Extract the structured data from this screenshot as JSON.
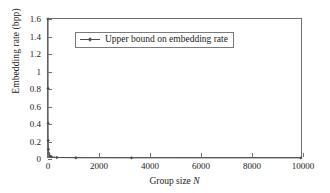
{
  "chart_data": {
    "type": "line",
    "title": "",
    "xlabel": "Group size N",
    "xlabel_plain": "Group size ",
    "xlabel_italic": "N",
    "ylabel": "Embedding rate (bpp)",
    "xlim": [
      0,
      10000
    ],
    "ylim": [
      0,
      1.6
    ],
    "grid": false,
    "legend_position": "upper-center",
    "xticks": [
      0,
      2000,
      4000,
      6000,
      8000,
      10000
    ],
    "xticklabels": [
      "0",
      "2000",
      "4000",
      "6000",
      "8000",
      "10000"
    ],
    "yticks": [
      0,
      0.2,
      0.4,
      0.6,
      0.8,
      1,
      1.2,
      1.4,
      1.6
    ],
    "yticklabels": [
      "0",
      "0.2",
      "0.4",
      "0.6",
      "0.8",
      "1",
      "1.2",
      "1.4",
      "1.6"
    ],
    "series": [
      {
        "name": "Upper bound on embedding rate",
        "marker": "diamond",
        "color": "#4d4d4d",
        "x": [
          1,
          2,
          4,
          8,
          16,
          32,
          64,
          128,
          350,
          1100,
          3300,
          10000
        ],
        "y": [
          1.6,
          0.8,
          0.4,
          0.2,
          0.1,
          0.05,
          0.025,
          0.0125,
          0.0046,
          0.0015,
          0.0005,
          0.00016
        ]
      }
    ]
  },
  "legend": {
    "entries": [
      {
        "label": "Upper bound on embedding rate"
      }
    ]
  },
  "colors": {
    "axis": "#6f6f6f",
    "curve": "#4d4d4d",
    "text": "#1a1a1a",
    "background": "#ffffff"
  }
}
